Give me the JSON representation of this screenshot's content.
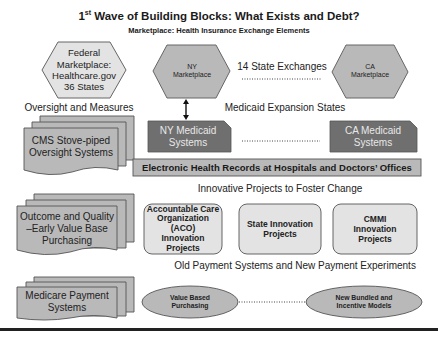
{
  "header": {
    "title_prefix": "1",
    "title_sup": "st",
    "title_rest": " Wave of Building Blocks: What Exists and Debt?",
    "subtitle": "Marketplace: Health Insurance Exchange Elements"
  },
  "marketplaces": {
    "federal": [
      "Federal",
      "Marketplace:",
      "Healthcare.gov",
      "36 States"
    ],
    "ny": [
      "NY",
      "Marketplace"
    ],
    "state_exchanges_label": "14 State Exchanges",
    "ca": [
      "CA",
      "Marketplace"
    ]
  },
  "oversight": {
    "section_label": "Oversight and Measures",
    "doc_label": [
      "CMS Stove-piped",
      "Oversight Systems"
    ]
  },
  "medicaid": {
    "section_label": "Medicaid Expansion States",
    "ny": [
      "NY Medicaid",
      "Systems"
    ],
    "ca": [
      "CA Medicaid",
      "Systems"
    ]
  },
  "ehr": {
    "label": "Electronic Health Records at Hospitals and Doctors’ Offices"
  },
  "innovation": {
    "section_label": "Innovative Projects to Foster Change",
    "doc_label": [
      "Outcome and Quality",
      "–Early Value Base",
      "Purchasing"
    ],
    "projects": [
      [
        "Accountable Care",
        "Organization (ACO)",
        "Innovation",
        "Projects"
      ],
      [
        "State Innovation",
        "Projects"
      ],
      [
        "CMMI",
        "Innovation",
        "Projects"
      ]
    ]
  },
  "payment": {
    "section_label": "Old Payment Systems and New Payment Experiments",
    "doc_label": [
      "Medicare Payment",
      "Systems"
    ],
    "value_based": [
      "Value Based",
      "Purchasing"
    ],
    "bundled": [
      "New Bundled and",
      "Incentive Models"
    ]
  },
  "colors": {
    "light_fill": "#e3e3e3",
    "mid_fill": "#b9b9b9",
    "dark_fill": "#6f6f6f",
    "stroke": "#555555",
    "rule": "#222222"
  }
}
